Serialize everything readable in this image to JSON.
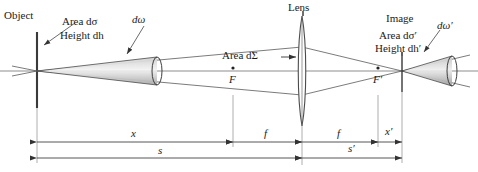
{
  "figure": {
    "type": "optics-ray-diagram",
    "title_visible": false,
    "colors": {
      "line": "#555555",
      "axis": "#888888",
      "text": "#1a1a1a",
      "cone_fill": "#b8b8b8",
      "object_line": "#333333"
    }
  },
  "labels": {
    "object": "Object",
    "area_do": "Area dσ",
    "height_dh": "Height dh",
    "domega": "dω",
    "lens": "Lens",
    "area_dsigma": "Area dΣ",
    "focal_point_front": "F",
    "focal_point_back": "F′",
    "image": "Image",
    "area_do_prime": "Area dσ′",
    "height_dh_prime": "Height dh′",
    "domega_prime": "dω′"
  },
  "dimensions": [
    {
      "id": "x",
      "label": "x",
      "from_px": 37,
      "to_px": 233
    },
    {
      "id": "f1",
      "label": "f",
      "from_px": 233,
      "to_px": 302
    },
    {
      "id": "f2",
      "label": "f",
      "from_px": 302,
      "to_px": 378
    },
    {
      "id": "xp",
      "label": "x′",
      "from_px": 378,
      "to_px": 402
    },
    {
      "id": "s",
      "label": "s",
      "from_px": 37,
      "to_px": 302
    },
    {
      "id": "sp",
      "label": "s′",
      "from_px": 302,
      "to_px": 402
    }
  ],
  "geometry": {
    "optical_axis_y": 71,
    "object_plane_x": 37,
    "lens_x": 302,
    "image_plane_x": 402,
    "front_focus_x": 233,
    "back_focus_x": 378,
    "cone_left_end_x": 157,
    "cone_right_end_x": 452
  }
}
